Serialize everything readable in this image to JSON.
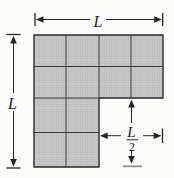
{
  "diagram": {
    "top_dimension": {
      "label": "L"
    },
    "left_dimension": {
      "label": "L"
    },
    "notch_dimension": {
      "numerator": "L",
      "denominator": "2"
    },
    "shape": {
      "upper_block": {
        "rows": 2,
        "cols": 4
      },
      "lower_block": {
        "rows": 2,
        "cols": 2
      },
      "total_squares": 12
    },
    "colors": {
      "square_fill": "#c6c6c6",
      "square_fill_dot": "#b1b1b1",
      "line": "#2a2a2a",
      "background": "#fbfbf9"
    }
  }
}
